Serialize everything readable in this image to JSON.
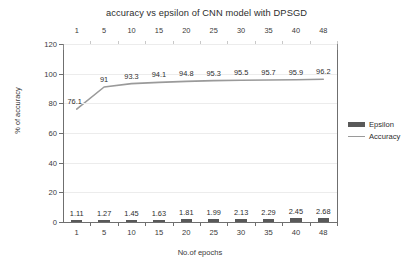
{
  "chart_data": {
    "type": "bar",
    "title": "accuracy vs epsilon of CNN model with DPSGD",
    "xlabel": "No.of epochs",
    "ylabel": "% of accuracy",
    "categories": [
      "1",
      "5",
      "10",
      "15",
      "20",
      "25",
      "30",
      "35",
      "40",
      "48"
    ],
    "top_axis_labels": [
      "1",
      "5",
      "10",
      "15",
      "20",
      "25",
      "30",
      "35",
      "40",
      "48"
    ],
    "series": [
      {
        "name": "Epsilon",
        "type": "bar",
        "color": "#595959",
        "values": [
          1.11,
          1.27,
          1.45,
          1.63,
          1.81,
          1.99,
          2.13,
          2.29,
          2.45,
          2.68
        ],
        "labels": [
          "1.11",
          "1.27",
          "1.45",
          "1.63",
          "1.81",
          "1.99",
          "2.13",
          "2.29",
          "2.45",
          "2.68"
        ]
      },
      {
        "name": "Accuracy",
        "type": "line",
        "color": "#9a9a9a",
        "values": [
          76.1,
          91,
          93.3,
          94.1,
          94.8,
          95.3,
          95.5,
          95.7,
          95.9,
          96.2
        ],
        "labels": [
          "76.1",
          "91",
          "93.3",
          "94.1",
          "94.8",
          "95.3",
          "95.5",
          "95.7",
          "95.9",
          "96.2"
        ]
      }
    ],
    "ylim": [
      0,
      120
    ],
    "yticks": [
      "0",
      "20",
      "40",
      "60",
      "80",
      "100",
      "120"
    ],
    "grid": true,
    "legend_position": "right",
    "legend": [
      "Epsilon",
      "Accuracy"
    ]
  },
  "colors": {
    "bar": "#595959",
    "line": "#9a9a9a",
    "axis": "#6f6f6f",
    "grid": "#ececec",
    "text": "#2d2d2d",
    "background": "#ffffff"
  }
}
